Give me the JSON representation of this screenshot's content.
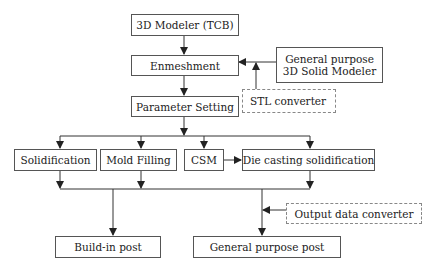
{
  "diagram": {
    "nodes": {
      "modeler_tcb": {
        "label": "3D Modeler (TCB)"
      },
      "enmeshment": {
        "label": "Enmeshment"
      },
      "general_solid_modeler": {
        "line1": "General purpose",
        "line2": "3D Solid Modeler"
      },
      "stl_converter": {
        "label": "STL converter"
      },
      "parameter_setting": {
        "label": "Parameter Setting"
      },
      "solidification": {
        "label": "Solidification"
      },
      "mold_filling": {
        "label": "Mold Filling"
      },
      "csm": {
        "label": "CSM"
      },
      "die_casting": {
        "label": "Die casting solidification"
      },
      "output_converter": {
        "label": "Output data converter"
      },
      "buildin_post": {
        "label": "Build-in post"
      },
      "general_post": {
        "label": "General purpose post"
      }
    },
    "edges": [
      [
        "3D Modeler (TCB)",
        "Enmeshment"
      ],
      [
        "General purpose 3D Solid Modeler",
        "Enmeshment"
      ],
      [
        "STL converter",
        "Enmeshment"
      ],
      [
        "Enmeshment",
        "Parameter Setting"
      ],
      [
        "Parameter Setting",
        "Solidification"
      ],
      [
        "Parameter Setting",
        "Mold Filling"
      ],
      [
        "Parameter Setting",
        "CSM"
      ],
      [
        "Parameter Setting",
        "Die casting solidification"
      ],
      [
        "CSM",
        "Die casting solidification"
      ],
      [
        "Solidification",
        "Build-in post"
      ],
      [
        "Mold Filling",
        "Build-in post"
      ],
      [
        "Die casting solidification",
        "General purpose post"
      ],
      [
        "Output data converter",
        "General purpose post"
      ]
    ],
    "colors": {
      "line": "#333333",
      "border": "#555555",
      "dashed_border": "#888888"
    }
  }
}
